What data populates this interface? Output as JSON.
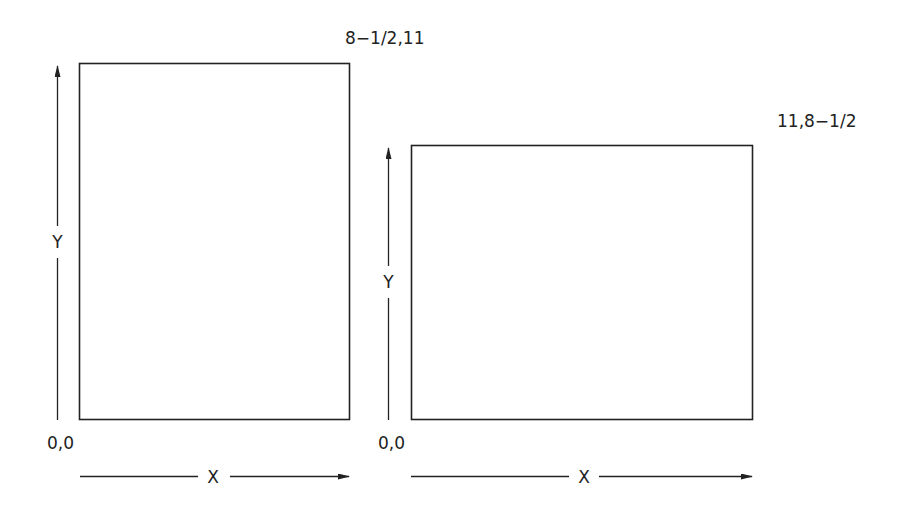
{
  "diagram": {
    "colors": {
      "line": "#222222",
      "text": "#222222",
      "background": "#ffffff"
    },
    "portrait": {
      "corner_label": "8−1/2,11",
      "origin_label": "0,0",
      "x_axis_label": "X",
      "y_axis_label": "Y",
      "width_in": "8-1/2",
      "height_in": "11"
    },
    "landscape": {
      "corner_label": "11,8−1/2",
      "origin_label": "0,0",
      "x_axis_label": "X",
      "y_axis_label": "Y",
      "width_in": "11",
      "height_in": "8-1/2"
    }
  }
}
